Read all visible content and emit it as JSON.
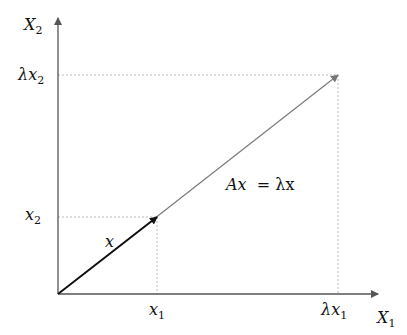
{
  "diagram": {
    "axes": {
      "x_axis_label": "X",
      "x_axis_sub": "1",
      "y_axis_label": "X",
      "y_axis_sub": "2"
    },
    "ticks": {
      "x1": {
        "main": "x",
        "sub": "1"
      },
      "lx1": {
        "main": "λx",
        "sub": "1"
      },
      "x2": {
        "main": "x",
        "sub": "2"
      },
      "lx2": {
        "main": "λx",
        "sub": "2"
      }
    },
    "vector_label": "x",
    "equation_left": "Ax",
    "equation_right": "= λx",
    "colors": {
      "axis": "#555555",
      "vector_x": "#222222",
      "vector_lambda_x": "#777777",
      "guides": "#bbbbbb"
    }
  }
}
